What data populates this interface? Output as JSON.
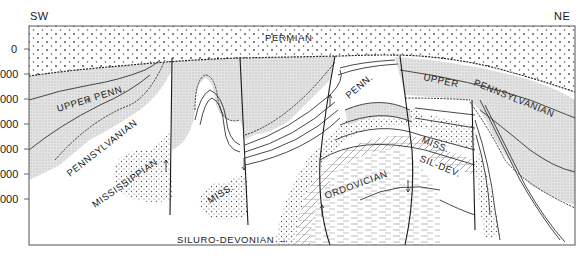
{
  "diagram": {
    "type": "geologic-cross-section",
    "orientation": {
      "left": "SW",
      "right": "NE"
    },
    "depth_axis": {
      "ticks": [
        "0",
        "000",
        "000",
        "000",
        "000",
        "000",
        "000"
      ]
    },
    "units": {
      "permian": "PERMIAN",
      "upper_penn_left": "UPPER PENN.",
      "uncertain_mark": "?",
      "pennsylvanian_left": "PENNSYLVANIAN",
      "mississippian_left": "MISSISSIPPIAN",
      "miss_center": "MISS.",
      "penn_center": "PENN.",
      "ordovician": "ORDOVICIAN",
      "upper_right": "UPPER",
      "pennsylvanian_right": "PENNSYLVANIAN",
      "miss_right": "MISS.",
      "sil_dev_right": "SIL-DEV.",
      "siluro_devonian_callout": "SILURO-DEVONIAN →"
    },
    "colors": {
      "line": "#2a2a2a",
      "frame": "#555555",
      "fine_stipple": "#d9d9d9",
      "background": "#ffffff"
    }
  }
}
